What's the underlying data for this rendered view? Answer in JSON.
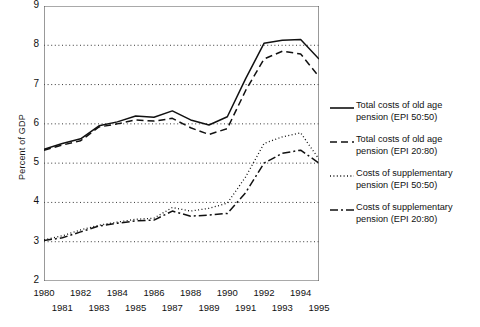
{
  "chart_data": {
    "type": "line",
    "title": "",
    "xlabel": "",
    "ylabel": "Percent of GDP",
    "xlim": [
      1980,
      1995
    ],
    "ylim": [
      2,
      9
    ],
    "yticks": [
      2,
      3,
      4,
      5,
      6,
      7,
      8,
      9
    ],
    "grid": "horizontal-dotted",
    "legend_position": "right",
    "x": [
      1980,
      1981,
      1982,
      1983,
      1984,
      1985,
      1986,
      1987,
      1988,
      1989,
      1990,
      1991,
      1992,
      1993,
      1994,
      1995
    ],
    "xtick_labels_row1": [
      "1980",
      "1982",
      "1984",
      "1986",
      "1988",
      "1990",
      "1992",
      "1994"
    ],
    "xtick_labels_row2": [
      "1981",
      "1983",
      "1985",
      "1987",
      "1989",
      "1991",
      "1993",
      "1995"
    ],
    "series": [
      {
        "name": "Total costs of  old age pension (EPI 50:50)",
        "style": "solid",
        "values": [
          5.35,
          5.5,
          5.62,
          5.95,
          6.05,
          6.2,
          6.17,
          6.33,
          6.1,
          5.97,
          6.18,
          7.15,
          8.05,
          8.13,
          8.15,
          7.65
        ]
      },
      {
        "name": "Total costs of old age pension (EPI 20:80)",
        "style": "dashed",
        "values": [
          5.33,
          5.46,
          5.57,
          5.92,
          6.0,
          6.1,
          6.07,
          6.14,
          5.9,
          5.73,
          5.88,
          6.85,
          7.65,
          7.85,
          7.78,
          7.2
        ]
      },
      {
        "name": "Costs of supplementary pension (EPI  50:50)",
        "style": "dotted",
        "values": [
          3.05,
          3.15,
          3.3,
          3.42,
          3.5,
          3.57,
          3.6,
          3.87,
          3.78,
          3.85,
          3.98,
          4.65,
          5.5,
          5.67,
          5.77,
          5.1
        ]
      },
      {
        "name": "Costs of supplementary pension (EPI 20:80)",
        "style": "dashdot",
        "values": [
          3.03,
          3.1,
          3.25,
          3.4,
          3.47,
          3.53,
          3.55,
          3.78,
          3.65,
          3.68,
          3.72,
          4.25,
          5.0,
          5.25,
          5.33,
          5.0
        ]
      }
    ]
  },
  "legend": {
    "items": [
      {
        "style": "solid",
        "label": "Total costs of  old age\npension (EPI 50:50)"
      },
      {
        "style": "dashed",
        "label": "Total costs of old age\npension (EPI 20:80)"
      },
      {
        "style": "dotted",
        "label": " Costs of supplementary\npension (EPI  50:50)"
      },
      {
        "style": "dashdot",
        "label": "Costs of supplementary\npension (EPI 20:80)"
      }
    ]
  }
}
